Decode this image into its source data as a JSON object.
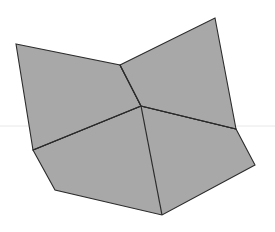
{
  "scene": {
    "title": "Three-face folded plane figure",
    "width": 275,
    "height": 232,
    "background_color": "#ffffff"
  },
  "style": {
    "face_fill": "#a8a8a8",
    "face_stroke": "#2b2b2b",
    "face_stroke_width": 1.1,
    "fold_stroke": "#2b2b2b",
    "fold_stroke_width": 1.2,
    "horizon_color": "#e8e8e8",
    "horizon_width": 1
  },
  "geometry": {
    "vertices": {
      "top_left_corner": {
        "label": "top-left corner",
        "x": 16,
        "y": 44
      },
      "notch_apex": {
        "label": "upper notch apex",
        "x": 120,
        "y": 65
      },
      "top_right_corner": {
        "label": "top-right corner",
        "x": 215,
        "y": 18
      },
      "center_junction": {
        "label": "central three-way junction",
        "x": 141,
        "y": 106
      },
      "left_junction": {
        "label": "left junction",
        "x": 33,
        "y": 150
      },
      "right_junction": {
        "label": "right junction",
        "x": 236,
        "y": 129
      },
      "bottom_left_corner": {
        "label": "bottom-left corner",
        "x": 55,
        "y": 190
      },
      "bottom_corner": {
        "label": "bottom corner",
        "x": 162,
        "y": 215
      },
      "bottom_right_corner": {
        "label": "bottom-right corner",
        "x": 255,
        "y": 165
      }
    },
    "faces": [
      {
        "name": "left-face",
        "label": "Left face",
        "points": "16,44 120,65 141,106 33,150",
        "fill": "#a8a8a8"
      },
      {
        "name": "right-face",
        "label": "Right face",
        "points": "120,65 215,18 236,129 141,106",
        "fill": "#a8a8a8"
      },
      {
        "name": "bottom-face",
        "label": "Bottom face",
        "points": "33,150 141,106 236,129 255,165 162,215 55,190",
        "fill": "#a8a8a8"
      }
    ],
    "fold_edges": [
      {
        "name": "fold-notch-to-center",
        "label": "Vertical fold (notch to center)",
        "d": "M120,65 L141,106"
      },
      {
        "name": "fold-center-to-left",
        "label": "Fold center to left junction",
        "d": "M141,106 L33,150"
      },
      {
        "name": "fold-center-to-right",
        "label": "Fold center to right junction",
        "d": "M141,106 L236,129"
      },
      {
        "name": "fold-center-to-bottom",
        "label": "Fold center to bottom corner",
        "d": "M141,106 L162,215"
      }
    ],
    "horizon_line": {
      "name": "horizon-line",
      "label": "Horizon reference line",
      "y": 126,
      "x_start": 0,
      "x_end": 275
    }
  }
}
